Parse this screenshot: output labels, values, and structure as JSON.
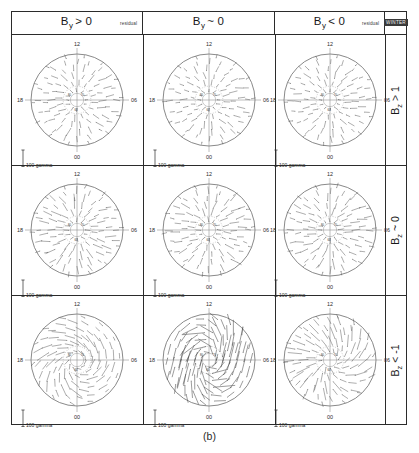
{
  "figure": {
    "caption": "(b)",
    "season_label": "WINTER",
    "residual_label": "residual",
    "scale_bar_label": "100 gamma",
    "clock_labels": {
      "top": "12",
      "right": "06",
      "bottom": "00",
      "left": "18"
    },
    "colors": {
      "frame": "#2b2b2b",
      "vector": "#4a4a4a",
      "circle": "#6b6b6b",
      "axis": "#8a8a8a"
    }
  },
  "columns": [
    {
      "id": "by-positive",
      "symbol": "B",
      "subscript": "y",
      "relation": "> 0",
      "title": "B y > 0",
      "has_residual": true
    },
    {
      "id": "by-zero",
      "symbol": "B",
      "subscript": "y",
      "relation": "~ 0",
      "title": "B y ~ 0",
      "has_residual": false
    },
    {
      "id": "by-negative",
      "symbol": "B",
      "subscript": "y",
      "relation": "< 0",
      "title": "B y < 0",
      "has_residual": true
    }
  ],
  "rows": [
    {
      "id": "bz-positive",
      "symbol": "B",
      "subscript": "z",
      "relation": "> 1",
      "title": "B z > 1"
    },
    {
      "id": "bz-zero",
      "symbol": "B",
      "subscript": "z",
      "relation": "~ 0",
      "title": "B z ~ 0"
    },
    {
      "id": "bz-negative",
      "symbol": "B",
      "subscript": "z",
      "relation": "< -1",
      "title": "B z < -1"
    }
  ],
  "chart_data": {
    "type": "scatter",
    "subtitle": "3x3 matrix sorted by IMF By (columns) and Bz (rows)",
    "plot_kind": "polar-vector-dial-grid",
    "xlabel": "Magnetic local time (hours)",
    "ylabel": "Magnetic latitude (degrees)",
    "units": "gamma (nT)",
    "scale_bar_value": 100,
    "scale_bar_units": "gamma",
    "mlt_ticks": [
      "12",
      "06",
      "00",
      "18"
    ],
    "mlt_tick_hours": [
      12,
      6,
      0,
      18
    ],
    "latitude_rings": [
      60,
      70,
      80
    ],
    "outer_boundary_latitude": 60,
    "grid": true,
    "legend": "none",
    "panel_count": 9,
    "panels": [
      {
        "row": "bz-positive",
        "col": "by-positive",
        "mean_vector_magnitude_gamma": 38,
        "pattern": "weak sunward-dominant residual flow",
        "max_vector_gamma": 70
      },
      {
        "row": "bz-positive",
        "col": "by-zero",
        "mean_vector_magnitude_gamma": 35,
        "pattern": "weak radial residual flow",
        "max_vector_gamma": 65
      },
      {
        "row": "bz-positive",
        "col": "by-negative",
        "mean_vector_magnitude_gamma": 36,
        "pattern": "weak sunward-dominant residual flow",
        "max_vector_gamma": 68
      },
      {
        "row": "bz-zero",
        "col": "by-positive",
        "mean_vector_magnitude_gamma": 45,
        "pattern": "moderate residual flow",
        "max_vector_gamma": 95
      },
      {
        "row": "bz-zero",
        "col": "by-zero",
        "mean_vector_magnitude_gamma": 42,
        "pattern": "moderate radial residual flow",
        "max_vector_gamma": 88
      },
      {
        "row": "bz-zero",
        "col": "by-negative",
        "mean_vector_magnitude_gamma": 44,
        "pattern": "moderate residual flow",
        "max_vector_gamma": 92
      },
      {
        "row": "bz-negative",
        "col": "by-positive",
        "mean_vector_magnitude_gamma": 60,
        "pattern": "enhanced duskward residual flow",
        "max_vector_gamma": 140
      },
      {
        "row": "bz-negative",
        "col": "by-zero",
        "mean_vector_magnitude_gamma": 95,
        "pattern": "strong two-cell convection vortex",
        "max_vector_gamma": 210
      },
      {
        "row": "bz-negative",
        "col": "by-negative",
        "mean_vector_magnitude_gamma": 58,
        "pattern": "enhanced dawnward residual flow",
        "max_vector_gamma": 135
      }
    ]
  }
}
